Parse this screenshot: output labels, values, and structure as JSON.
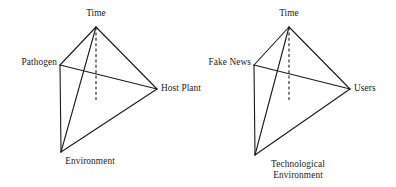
{
  "figure": {
    "background_color": "#ffffff",
    "line_color": "#1a1a1a",
    "diagrams": [
      {
        "id": "plant-disease-tetrahedron",
        "vertices": {
          "apex": {
            "label": "Time",
            "x": 96,
            "y": 27
          },
          "left": {
            "label": "Pathogen",
            "x": 60,
            "y": 65
          },
          "right": {
            "label": "Host Plant",
            "x": 157,
            "y": 89
          },
          "bottom": {
            "label": "Environment",
            "x": 61,
            "y": 152
          }
        },
        "axis": {
          "from_y": 27,
          "to_y": 100,
          "x": 96,
          "style": "dashed"
        }
      },
      {
        "id": "fake-news-tetrahedron",
        "vertices": {
          "apex": {
            "label": "Time",
            "x": 91,
            "y": 27
          },
          "left": {
            "label": "Fake News",
            "x": 56,
            "y": 65
          },
          "right": {
            "label": "Users",
            "x": 152,
            "y": 89
          },
          "bottom": {
            "label": "Technological Environment",
            "x": 57,
            "y": 155
          }
        },
        "axis": {
          "from_y": 27,
          "to_y": 100,
          "x": 91,
          "style": "dashed"
        }
      }
    ]
  }
}
